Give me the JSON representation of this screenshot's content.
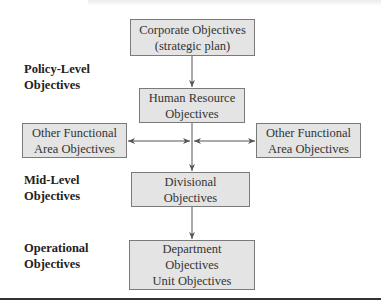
{
  "diagram": {
    "nodes": [
      {
        "id": "corporate",
        "lines": [
          "Corporate Objectives",
          "(strategic plan)"
        ]
      },
      {
        "id": "hr",
        "lines": [
          "Human Resource",
          "Objectives"
        ]
      },
      {
        "id": "ofa_left",
        "lines": [
          "Other Functional",
          "Area Objectives"
        ]
      },
      {
        "id": "ofa_right",
        "lines": [
          "Other Functional",
          "Area Objectives"
        ]
      },
      {
        "id": "divisional",
        "lines": [
          "Divisional",
          "Objectives"
        ]
      },
      {
        "id": "department",
        "lines": [
          "Department",
          "Objectives",
          "Unit Objectives"
        ]
      }
    ],
    "levels": [
      {
        "lines": [
          "Policy-Level",
          "Objectives"
        ]
      },
      {
        "lines": [
          "Mid-Level",
          "Objectives"
        ]
      },
      {
        "lines": [
          "Operational",
          "Objectives"
        ]
      }
    ],
    "edges": [
      {
        "from": "corporate",
        "to": "hr",
        "type": "arrow"
      },
      {
        "from": "hr",
        "to": "divisional",
        "type": "arrow"
      },
      {
        "from": "hr",
        "to": "ofa_left",
        "type": "bidirectional"
      },
      {
        "from": "hr",
        "to": "ofa_right",
        "type": "bidirectional"
      },
      {
        "from": "divisional",
        "to": "department",
        "type": "arrow"
      }
    ],
    "colors": {
      "box_fill": "#e4e4e4",
      "box_border": "#7a7a7a",
      "line": "#555555",
      "rule": "#333333"
    }
  }
}
